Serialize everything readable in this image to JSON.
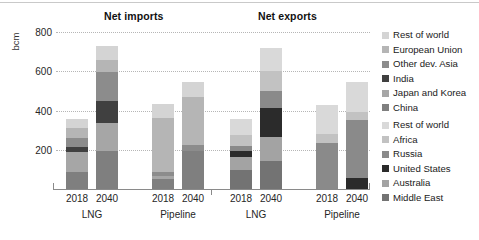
{
  "chart_data": {
    "type": "bar",
    "subtype": "stacked-bar",
    "title": "",
    "panels": [
      {
        "key": "imports",
        "title": "Net imports"
      },
      {
        "key": "exports",
        "title": "Net exports"
      }
    ],
    "ylabel": "bcm",
    "xlabel": "",
    "ylim": [
      0,
      800
    ],
    "yticks": [
      200,
      400,
      600,
      800
    ],
    "ytick_labels": [
      "200",
      "400",
      "600",
      "800"
    ],
    "grid": true,
    "legend_position": "right",
    "categories": [
      "2018",
      "2040",
      "2018",
      "2040"
    ],
    "group_labels": [
      "LNG",
      "Pipeline"
    ],
    "imports": {
      "series": [
        {
          "name": "China",
          "color": "#7f7f7f",
          "values": [
            85,
            195,
            50,
            195
          ]
        },
        {
          "name": "Japan and Korea",
          "color": "#a6a6a6",
          "values": [
            105,
            140,
            15,
            0
          ]
        },
        {
          "name": "India",
          "color": "#404040",
          "values": [
            25,
            115,
            0,
            0
          ]
        },
        {
          "name": "Other dev. Asia",
          "color": "#8c8c8c",
          "values": [
            45,
            145,
            20,
            30
          ]
        },
        {
          "name": "European Union",
          "color": "#b5b5b5",
          "values": [
            50,
            65,
            275,
            245
          ]
        },
        {
          "name": "Rest of world",
          "color": "#d4d4d4",
          "values": [
            45,
            70,
            75,
            75
          ]
        }
      ],
      "totals": [
        355,
        730,
        435,
        545
      ]
    },
    "exports": {
      "series": [
        {
          "name": "Middle East",
          "color": "#737373",
          "values": [
            95,
            145,
            0,
            0
          ]
        },
        {
          "name": "Australia",
          "color": "#a3a3a3",
          "values": [
            70,
            120,
            0,
            0
          ]
        },
        {
          "name": "United States",
          "color": "#2b2b2b",
          "values": [
            30,
            150,
            0,
            55
          ]
        },
        {
          "name": "Russia",
          "color": "#8a8a8a",
          "values": [
            25,
            85,
            235,
            295
          ]
        },
        {
          "name": "Africa",
          "color": "#c2c2c2",
          "values": [
            55,
            100,
            45,
            40
          ]
        },
        {
          "name": "Rest of world",
          "color": "#d9d9d9",
          "values": [
            80,
            120,
            150,
            155
          ]
        }
      ],
      "totals": [
        355,
        720,
        430,
        545
      ]
    },
    "legend_top": {
      "entries": [
        {
          "label": "Rest of world",
          "color": "#d4d4d4"
        },
        {
          "label": "European Union",
          "color": "#b5b5b5"
        },
        {
          "label": "Other dev. Asia",
          "color": "#8c8c8c"
        },
        {
          "label": "India",
          "color": "#404040"
        },
        {
          "label": "Japan and Korea",
          "color": "#a6a6a6"
        },
        {
          "label": "China",
          "color": "#7f7f7f"
        }
      ]
    },
    "legend_bottom": {
      "entries": [
        {
          "label": "Rest of world",
          "color": "#d9d9d9"
        },
        {
          "label": "Africa",
          "color": "#c2c2c2"
        },
        {
          "label": "Russia",
          "color": "#8a8a8a"
        },
        {
          "label": "United States",
          "color": "#2b2b2b"
        },
        {
          "label": "Australia",
          "color": "#a3a3a3"
        },
        {
          "label": "Middle East",
          "color": "#737373"
        }
      ]
    }
  },
  "axis": {
    "unit": "bcm",
    "ticks": [
      "800",
      "600",
      "400",
      "200"
    ]
  },
  "titles": {
    "imports": "Net imports",
    "exports": "Net exports"
  },
  "xaxis": {
    "ticks": [
      "2018",
      "2040",
      "2018",
      "2040",
      "2018",
      "2040",
      "2018",
      "2040"
    ],
    "groups": [
      "LNG",
      "Pipeline",
      "LNG",
      "Pipeline"
    ]
  }
}
